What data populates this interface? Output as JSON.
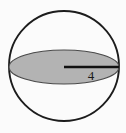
{
  "figure": {
    "kind": "sphere-with-great-circle-diagram",
    "background_color": "#fbfbfb",
    "sphere": {
      "name": "sphere-outline",
      "center_x": 64,
      "center_y": 66,
      "radius": 55,
      "stroke_color": "#1c1c1c",
      "stroke_width": 1.9,
      "fill_color": "none"
    },
    "great_circle": {
      "name": "great-circle-ellipse",
      "center_x": 64,
      "center_y": 67,
      "semi_major_axis": 55,
      "semi_minor_axis": 17,
      "fill_color": "#b3b3b3",
      "stroke_color": "#4a4a4a",
      "stroke_width": 1.2
    },
    "radius_segment": {
      "name": "radius-line",
      "x1": 64,
      "y1": 67,
      "x2": 119,
      "y2": 67,
      "stroke_color": "#111111",
      "stroke_width": 2.4
    },
    "measurement_label": {
      "name": "radius-length-label",
      "text": "4",
      "x": 91,
      "y": 77,
      "font_size_px": 13,
      "color": "#1a1a1a"
    }
  }
}
